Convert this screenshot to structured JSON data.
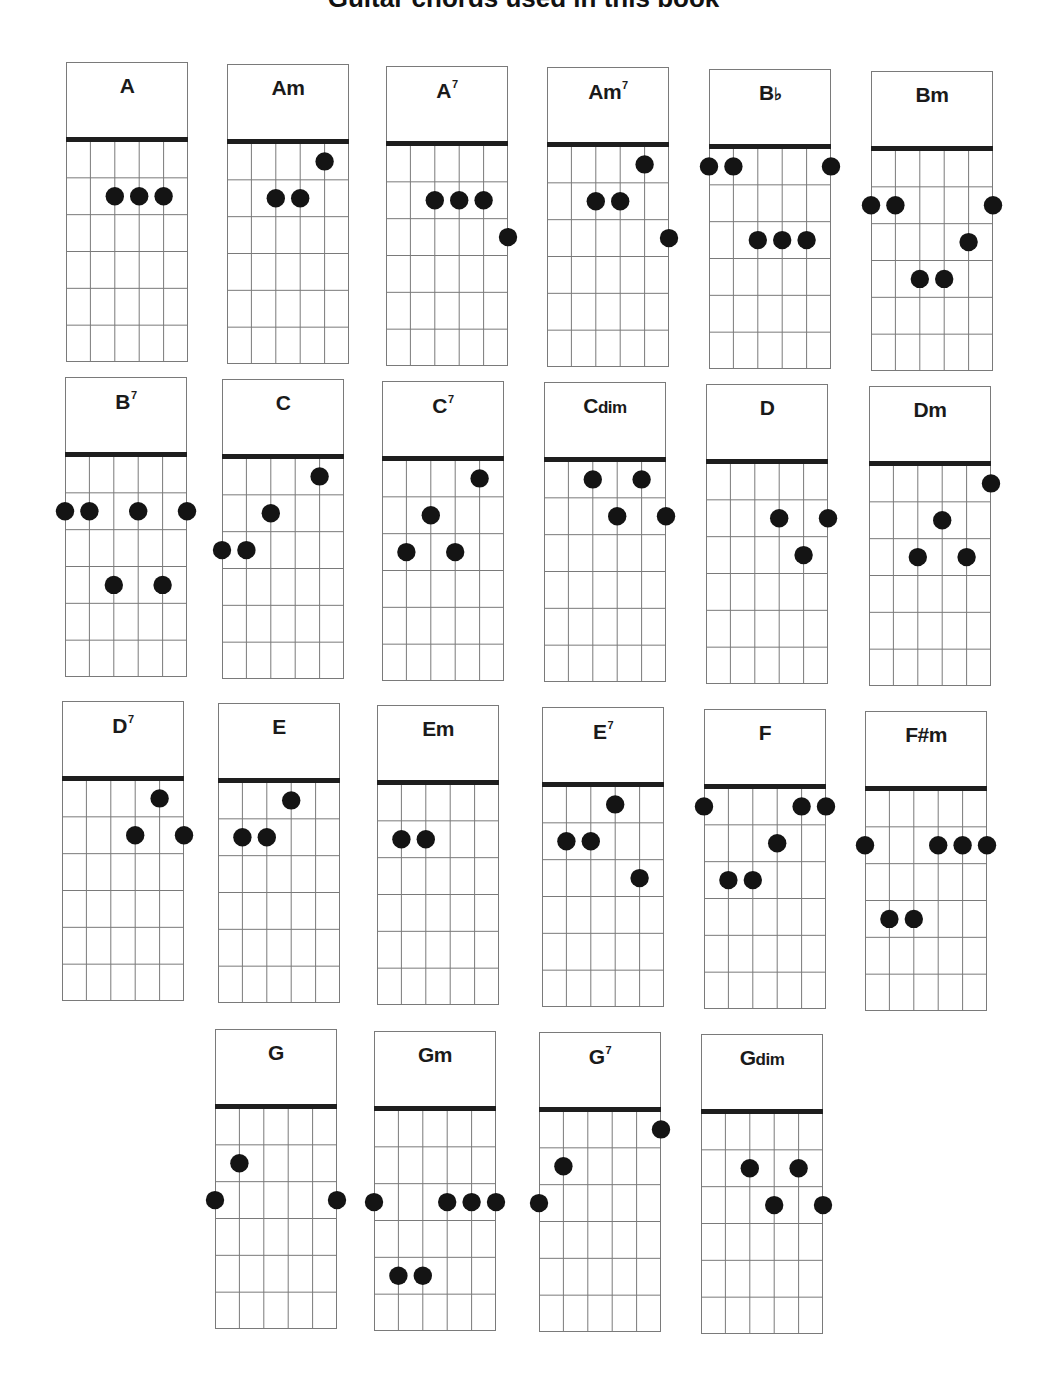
{
  "title": "Guitar chords used in this book",
  "chart_data": {
    "type": "table",
    "title": "Guitar chords used in this book",
    "strings": 6,
    "frets_shown": 6,
    "note": "positions listed as [string (1=leftmost), fret (1=nearest nut)]",
    "chords": [
      {
        "name": "A",
        "base": "A",
        "suffix": "",
        "sup": "",
        "x": 66,
        "y": 62,
        "dots": [
          [
            3,
            2
          ],
          [
            4,
            2
          ],
          [
            5,
            2
          ]
        ]
      },
      {
        "name": "Am",
        "base": "Am",
        "suffix": "",
        "sup": "",
        "x": 227,
        "y": 64,
        "dots": [
          [
            5,
            1
          ],
          [
            3,
            2
          ],
          [
            4,
            2
          ]
        ]
      },
      {
        "name": "A7",
        "base": "A",
        "suffix": "",
        "sup": "7",
        "x": 386,
        "y": 66,
        "dots": [
          [
            3,
            2
          ],
          [
            4,
            2
          ],
          [
            5,
            2
          ],
          [
            6,
            3
          ]
        ]
      },
      {
        "name": "Am7",
        "base": "Am",
        "suffix": "",
        "sup": "7",
        "x": 547,
        "y": 67,
        "dots": [
          [
            5,
            1
          ],
          [
            3,
            2
          ],
          [
            4,
            2
          ],
          [
            6,
            3
          ]
        ]
      },
      {
        "name": "Bb",
        "base": "B",
        "suffix": "♭",
        "sup": "",
        "x": 709,
        "y": 69,
        "dots": [
          [
            1,
            1
          ],
          [
            2,
            1
          ],
          [
            6,
            1
          ],
          [
            3,
            3
          ],
          [
            4,
            3
          ],
          [
            5,
            3
          ]
        ]
      },
      {
        "name": "Bm",
        "base": "Bm",
        "suffix": "",
        "sup": "",
        "x": 871,
        "y": 71,
        "dots": [
          [
            1,
            2
          ],
          [
            2,
            2
          ],
          [
            6,
            2
          ],
          [
            5,
            3
          ],
          [
            3,
            4
          ],
          [
            4,
            4
          ]
        ]
      },
      {
        "name": "B7",
        "base": "B",
        "suffix": "",
        "sup": "7",
        "x": 65,
        "y": 377,
        "dots": [
          [
            1,
            2
          ],
          [
            2,
            2
          ],
          [
            4,
            2
          ],
          [
            6,
            2
          ],
          [
            3,
            4
          ],
          [
            5,
            4
          ]
        ]
      },
      {
        "name": "C",
        "base": "C",
        "suffix": "",
        "sup": "",
        "x": 222,
        "y": 379,
        "dots": [
          [
            5,
            1
          ],
          [
            3,
            2
          ],
          [
            1,
            3
          ],
          [
            2,
            3
          ]
        ]
      },
      {
        "name": "C7",
        "base": "C",
        "suffix": "",
        "sup": "7",
        "x": 382,
        "y": 381,
        "dots": [
          [
            5,
            1
          ],
          [
            3,
            2
          ],
          [
            2,
            3
          ],
          [
            4,
            3
          ]
        ]
      },
      {
        "name": "Cdim",
        "base": "C",
        "suffix": "dim",
        "sup": "",
        "x": 544,
        "y": 382,
        "dots": [
          [
            3,
            1
          ],
          [
            5,
            1
          ],
          [
            4,
            2
          ],
          [
            6,
            2
          ]
        ]
      },
      {
        "name": "D",
        "base": "D",
        "suffix": "",
        "sup": "",
        "x": 706,
        "y": 384,
        "dots": [
          [
            4,
            2
          ],
          [
            6,
            2
          ],
          [
            5,
            3
          ]
        ]
      },
      {
        "name": "Dm",
        "base": "Dm",
        "suffix": "",
        "sup": "",
        "x": 869,
        "y": 386,
        "dots": [
          [
            6,
            1
          ],
          [
            4,
            2
          ],
          [
            3,
            3
          ],
          [
            5,
            3
          ]
        ]
      },
      {
        "name": "D7",
        "base": "D",
        "suffix": "",
        "sup": "7",
        "x": 62,
        "y": 701,
        "dots": [
          [
            5,
            1
          ],
          [
            4,
            2
          ],
          [
            6,
            2
          ]
        ]
      },
      {
        "name": "E",
        "base": "E",
        "suffix": "",
        "sup": "",
        "x": 218,
        "y": 703,
        "dots": [
          [
            4,
            1
          ],
          [
            2,
            2
          ],
          [
            3,
            2
          ]
        ]
      },
      {
        "name": "Em",
        "base": "Em",
        "suffix": "",
        "sup": "",
        "x": 377,
        "y": 705,
        "dots": [
          [
            2,
            2
          ],
          [
            3,
            2
          ]
        ]
      },
      {
        "name": "E7",
        "base": "E",
        "suffix": "",
        "sup": "7",
        "x": 542,
        "y": 707,
        "dots": [
          [
            4,
            1
          ],
          [
            2,
            2
          ],
          [
            3,
            2
          ],
          [
            5,
            3
          ]
        ]
      },
      {
        "name": "F",
        "base": "F",
        "suffix": "",
        "sup": "",
        "x": 704,
        "y": 709,
        "dots": [
          [
            1,
            1
          ],
          [
            5,
            1
          ],
          [
            6,
            1
          ],
          [
            4,
            2
          ],
          [
            2,
            3
          ],
          [
            3,
            3
          ]
        ]
      },
      {
        "name": "F#m",
        "base": "F#m",
        "suffix": "",
        "sup": "",
        "x": 865,
        "y": 711,
        "dots": [
          [
            1,
            2
          ],
          [
            4,
            2
          ],
          [
            5,
            2
          ],
          [
            6,
            2
          ],
          [
            2,
            4
          ],
          [
            3,
            4
          ]
        ]
      },
      {
        "name": "G",
        "base": "G",
        "suffix": "",
        "sup": "",
        "x": 215,
        "y": 1029,
        "dots": [
          [
            2,
            2
          ],
          [
            1,
            3
          ],
          [
            6,
            3
          ]
        ]
      },
      {
        "name": "Gm",
        "base": "Gm",
        "suffix": "",
        "sup": "",
        "x": 374,
        "y": 1031,
        "dots": [
          [
            1,
            3
          ],
          [
            4,
            3
          ],
          [
            5,
            3
          ],
          [
            6,
            3
          ],
          [
            2,
            5
          ],
          [
            3,
            5
          ]
        ]
      },
      {
        "name": "G7",
        "base": "G",
        "suffix": "",
        "sup": "7",
        "x": 539,
        "y": 1032,
        "dots": [
          [
            6,
            1
          ],
          [
            2,
            2
          ],
          [
            1,
            3
          ]
        ]
      },
      {
        "name": "Gdim",
        "base": "G",
        "suffix": "dim",
        "sup": "",
        "x": 701,
        "y": 1034,
        "dots": [
          [
            3,
            2
          ],
          [
            5,
            2
          ],
          [
            4,
            3
          ],
          [
            6,
            3
          ]
        ]
      }
    ]
  },
  "colors": {
    "grid": "#7a7a7a",
    "nut": "#1e1e1e",
    "dot": "#141414",
    "label": "#1a1a1a"
  }
}
